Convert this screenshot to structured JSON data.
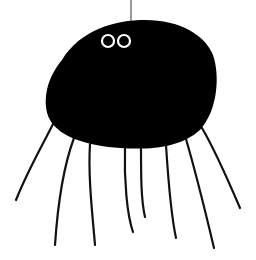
{
  "illustration": {
    "subject": "Black spider hanging from a thread",
    "colors": {
      "background": "#ffffff",
      "body": "#000000",
      "eye_white": "#ffffff",
      "eye_pupil": "#000000",
      "legs": "#111111",
      "thread": "#555555"
    },
    "leg_count": 8,
    "eye_count": 2
  }
}
